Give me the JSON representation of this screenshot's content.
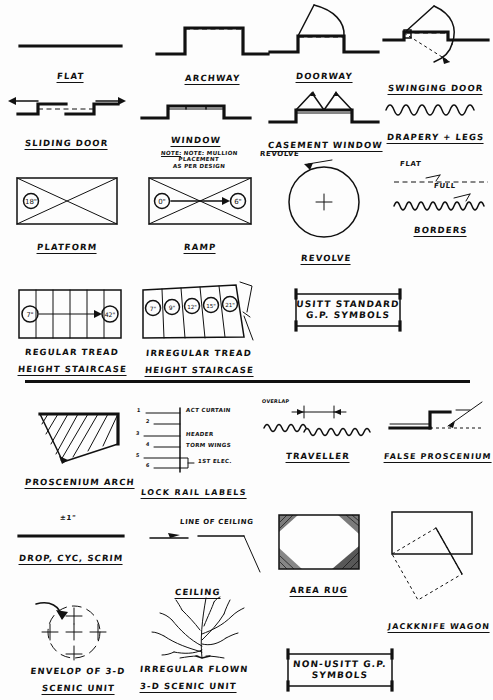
{
  "sheet": {
    "title": "USITT Standard Ground Plan Symbols",
    "group_labels": {
      "usitt_box": [
        "USITT STANDARD",
        "G.P. SYMBOLS"
      ],
      "non_usitt_box": [
        "NON-USITT G.P.",
        "SYMBOLS"
      ]
    }
  },
  "symbols": [
    {
      "id": "flat",
      "label": "FLAT"
    },
    {
      "id": "archway",
      "label": "ARCHWAY"
    },
    {
      "id": "doorway",
      "label": "DOORWAY"
    },
    {
      "id": "swinging-door",
      "label": "SWINGING DOOR"
    },
    {
      "id": "sliding-door",
      "label": "SLIDING DOOR"
    },
    {
      "id": "window",
      "label": "WINDOW",
      "note": [
        "NOTE: MULLION PLACEMENT",
        "AS PER DESIGN"
      ],
      "note_prefix": "NOTE:"
    },
    {
      "id": "casement-window",
      "label": "CASEMENT WINDOW"
    },
    {
      "id": "drapery-legs",
      "label": "DRAPERY + LEGS"
    },
    {
      "id": "platform",
      "label": "PLATFORM",
      "height_tag": "18\""
    },
    {
      "id": "ramp",
      "label": "RAMP",
      "low_tag": "0\"",
      "high_tag": "6\""
    },
    {
      "id": "revolve",
      "label": "REVOLVE",
      "callout": "REVOLVE"
    },
    {
      "id": "borders",
      "label": "BORDERS",
      "flat_tag": "FLAT",
      "full_tag": "FULL"
    },
    {
      "id": "regular-stair",
      "label": [
        "REGULAR TREAD",
        "HEIGHT STAIRCASE"
      ],
      "first_tread": "7\"",
      "last_tread": "42\""
    },
    {
      "id": "irregular-stair",
      "label": [
        "IRREGULAR TREAD",
        "HEIGHT STAIRCASE"
      ],
      "treads": [
        "7\"",
        "9\"",
        "12\"",
        "15\"",
        "21\""
      ]
    },
    {
      "id": "proscenium-arch",
      "label": "PROSCENIUM ARCH"
    },
    {
      "id": "lock-rail-labels",
      "label": "LOCK RAIL LABELS",
      "rows": [
        {
          "num": "1",
          "text": "ACT CURTAIN"
        },
        {
          "num": "2",
          "text": ""
        },
        {
          "num": "3",
          "text": "HEADER"
        },
        {
          "num": "4",
          "text": "TORM WINGS"
        },
        {
          "num": "5",
          "text": ""
        },
        {
          "num": "6",
          "text": "1ST ELEC."
        }
      ]
    },
    {
      "id": "traveller",
      "label": "TRAVELLER",
      "dim_tag": "OVERLAP"
    },
    {
      "id": "false-proscenium",
      "label": "FALSE PROSCENIUM"
    },
    {
      "id": "drop-cyc-scrim",
      "label": "DROP, CYC, SCRIM",
      "tolerance": "±1\""
    },
    {
      "id": "ceiling",
      "label": "CEILING",
      "callout": "LINE OF CEILING"
    },
    {
      "id": "area-rug",
      "label": "AREA RUG"
    },
    {
      "id": "jackknife-wagon",
      "label": "JACKKNIFE WAGON"
    },
    {
      "id": "envelop-3d",
      "label": [
        "ENVELOP OF 3-D",
        "SCENIC UNIT"
      ]
    },
    {
      "id": "irregular-flown",
      "label": [
        "IRREGULAR FLOWN",
        "3-D SCENIC UNIT"
      ]
    }
  ]
}
